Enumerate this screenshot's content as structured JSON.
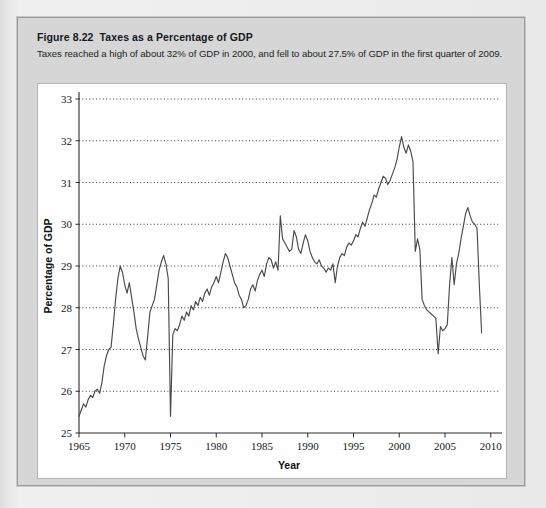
{
  "figure": {
    "number_label": "Figure 8.22",
    "title": "Taxes as a Percentage of GDP",
    "subtitle": "Taxes reached a high of about 32% of GDP in 2000, and fell to about 27.5% of GDP in the first quarter of 2009."
  },
  "colors": {
    "page_background": "#ededee",
    "figure_panel": "#d6d6d7",
    "figure_border": "#9a9a9a",
    "chart_background": "#fefefe",
    "chart_border": "#b4b4b4",
    "line": "#4a4a4a",
    "gridline": "#3c3c3c",
    "axis": "#2b2b2b",
    "text": "#16181b"
  },
  "chart_data": {
    "type": "line",
    "title": "Taxes as a Percentage of GDP",
    "xlabel": "Year",
    "ylabel": "Percentage of GDP",
    "xlim": [
      1965,
      2010.9
    ],
    "ylim": [
      25,
      33
    ],
    "xticks": [
      1965,
      1970,
      1975,
      1980,
      1985,
      1990,
      1995,
      2000,
      2005,
      2010
    ],
    "xtick_labels": [
      "1965",
      "1970",
      "1975",
      "1980",
      "1985",
      "1990",
      "1995",
      "2000",
      "2005",
      "2010"
    ],
    "yticks": [
      25,
      26,
      27,
      28,
      29,
      30,
      31,
      32,
      33
    ],
    "ytick_labels": [
      "25",
      "26",
      "27",
      "28",
      "29",
      "30",
      "31",
      "32",
      "33"
    ],
    "grid": "horizontal-dotted",
    "legend": "none",
    "series": [
      {
        "name": "Taxes as a percentage of GDP",
        "x": [
          1965.0,
          1965.25,
          1965.5,
          1965.75,
          1966.0,
          1966.25,
          1966.5,
          1966.75,
          1967.0,
          1967.25,
          1967.5,
          1967.75,
          1968.0,
          1968.25,
          1968.5,
          1968.75,
          1969.0,
          1969.25,
          1969.5,
          1969.75,
          1970.0,
          1970.25,
          1970.5,
          1970.75,
          1971.0,
          1971.25,
          1971.5,
          1971.75,
          1972.0,
          1972.25,
          1972.5,
          1972.75,
          1973.0,
          1973.25,
          1973.5,
          1973.75,
          1974.0,
          1974.25,
          1974.5,
          1974.75,
          1975.0,
          1975.25,
          1975.5,
          1975.75,
          1976.0,
          1976.25,
          1976.5,
          1976.75,
          1977.0,
          1977.25,
          1977.5,
          1977.75,
          1978.0,
          1978.25,
          1978.5,
          1978.75,
          1979.0,
          1979.25,
          1979.5,
          1979.75,
          1980.0,
          1980.25,
          1980.5,
          1980.75,
          1981.0,
          1981.25,
          1981.5,
          1981.75,
          1982.0,
          1982.25,
          1982.5,
          1982.75,
          1983.0,
          1983.25,
          1983.5,
          1983.75,
          1984.0,
          1984.25,
          1984.5,
          1984.75,
          1985.0,
          1985.25,
          1985.5,
          1985.75,
          1986.0,
          1986.25,
          1986.5,
          1986.75,
          1987.0,
          1987.25,
          1987.5,
          1987.75,
          1988.0,
          1988.25,
          1988.5,
          1988.75,
          1989.0,
          1989.25,
          1989.5,
          1989.75,
          1990.0,
          1990.25,
          1990.5,
          1990.75,
          1991.0,
          1991.25,
          1991.5,
          1991.75,
          1992.0,
          1992.25,
          1992.5,
          1992.75,
          1993.0,
          1993.25,
          1993.5,
          1993.75,
          1994.0,
          1994.25,
          1994.5,
          1994.75,
          1995.0,
          1995.25,
          1995.5,
          1995.75,
          1996.0,
          1996.25,
          1996.5,
          1996.75,
          1997.0,
          1997.25,
          1997.5,
          1997.75,
          1998.0,
          1998.25,
          1998.5,
          1998.75,
          1999.0,
          1999.25,
          1999.5,
          1999.75,
          2000.0,
          2000.25,
          2000.5,
          2000.75,
          2001.0,
          2001.25,
          2001.5,
          2001.75,
          2002.0,
          2002.25,
          2002.5,
          2002.75,
          2003.0,
          2003.25,
          2003.5,
          2003.75,
          2004.0,
          2004.25,
          2004.5,
          2004.75,
          2005.0,
          2005.25,
          2005.5,
          2005.75,
          2006.0,
          2006.25,
          2006.5,
          2006.75,
          2007.0,
          2007.25,
          2007.5,
          2007.75,
          2008.0,
          2008.25,
          2008.5,
          2008.75,
          2009.0
        ],
        "y": [
          25.4,
          25.55,
          25.7,
          25.62,
          25.8,
          25.9,
          25.85,
          26.0,
          26.05,
          25.95,
          26.2,
          26.6,
          26.85,
          27.0,
          27.05,
          27.6,
          28.2,
          28.7,
          29.0,
          28.85,
          28.55,
          28.35,
          28.6,
          28.25,
          27.9,
          27.5,
          27.25,
          27.05,
          26.85,
          26.75,
          27.3,
          27.9,
          28.05,
          28.2,
          28.55,
          28.9,
          29.1,
          29.25,
          29.05,
          28.7,
          25.4,
          27.35,
          27.5,
          27.45,
          27.6,
          27.8,
          27.7,
          27.9,
          27.8,
          28.05,
          27.95,
          28.15,
          28.05,
          28.25,
          28.15,
          28.35,
          28.45,
          28.3,
          28.5,
          28.6,
          28.75,
          28.6,
          28.85,
          29.1,
          29.3,
          29.2,
          29.0,
          28.8,
          28.6,
          28.5,
          28.3,
          28.2,
          28.0,
          28.05,
          28.2,
          28.45,
          28.55,
          28.4,
          28.65,
          28.8,
          28.9,
          28.75,
          29.05,
          29.2,
          29.15,
          28.95,
          29.1,
          28.9,
          30.2,
          29.65,
          29.55,
          29.45,
          29.35,
          29.4,
          29.85,
          29.7,
          29.4,
          29.3,
          29.55,
          29.75,
          29.6,
          29.35,
          29.2,
          29.1,
          29.05,
          29.15,
          29.0,
          28.95,
          28.85,
          28.95,
          28.9,
          29.05,
          28.6,
          29.0,
          29.2,
          29.3,
          29.25,
          29.45,
          29.55,
          29.5,
          29.6,
          29.75,
          29.7,
          29.9,
          30.05,
          29.95,
          30.15,
          30.35,
          30.5,
          30.7,
          30.65,
          30.85,
          31.0,
          31.15,
          31.1,
          30.95,
          31.05,
          31.2,
          31.35,
          31.55,
          31.85,
          32.1,
          31.85,
          31.7,
          31.9,
          31.75,
          31.5,
          29.35,
          29.65,
          29.4,
          28.2,
          28.05,
          27.95,
          27.9,
          27.85,
          27.8,
          27.75,
          26.9,
          27.55,
          27.45,
          27.5,
          27.6,
          28.55,
          29.2,
          28.55,
          29.05,
          29.3,
          29.65,
          29.95,
          30.25,
          30.4,
          30.2,
          30.05,
          30.0,
          29.9,
          28.55,
          27.4
        ]
      }
    ],
    "annotations": {
      "peak_year": "2000",
      "peak_value": "32",
      "end_value": "27.5",
      "end_period": "first quarter of 2009"
    }
  }
}
